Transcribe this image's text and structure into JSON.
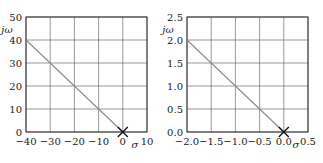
{
  "chart_data": [
    {
      "type": "line",
      "title": "",
      "xlabel": "σ",
      "ylabel": "jω",
      "xlim": [
        -40,
        10
      ],
      "ylim": [
        0,
        50
      ],
      "xticks": [
        "−40",
        "−30",
        "−20",
        "−10",
        "0",
        "10"
      ],
      "yticks": [
        "0",
        "10",
        "20",
        "30",
        "40",
        "50"
      ],
      "grid": true,
      "series": [
        {
          "name": "locus",
          "x": [
            -40,
            0
          ],
          "y": [
            40,
            0
          ],
          "color": "#8a8a8a"
        }
      ],
      "markers": [
        {
          "x": 0,
          "y": 0,
          "symbol": "x"
        }
      ]
    },
    {
      "type": "line",
      "title": "",
      "xlabel": "σ",
      "ylabel": "jω",
      "xlim": [
        -2.0,
        0.5
      ],
      "ylim": [
        0,
        2.5
      ],
      "xticks": [
        "−2.0",
        "−1.5",
        "−1.0",
        "−0.5",
        "0.0",
        "0.5"
      ],
      "yticks": [
        "0.0",
        "0.5",
        "1.0",
        "1.5",
        "2.0",
        "2.5"
      ],
      "grid": true,
      "series": [
        {
          "name": "locus",
          "x": [
            -2.0,
            0.0
          ],
          "y": [
            2.0,
            0.0
          ],
          "color": "#8a8a8a"
        }
      ],
      "markers": [
        {
          "x": 0.0,
          "y": 0.0,
          "symbol": "x"
        }
      ]
    }
  ]
}
